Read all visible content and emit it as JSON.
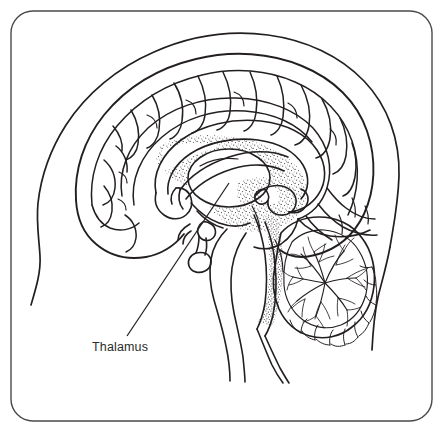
{
  "figure": {
    "kind": "anatomical-line-diagram",
    "background_color": "#ffffff",
    "ink_color": "#231f20",
    "frame": {
      "present": true,
      "shape": "rounded-rectangle",
      "stroke_color": "#4a4a4a",
      "x": 11,
      "y": 11,
      "width": 421,
      "height": 410,
      "corner_radius": 22
    },
    "labels": [
      {
        "id": "thalamus",
        "text": "Thalamus",
        "text_x": 92,
        "text_y": 351,
        "leader_from_x": 127,
        "leader_from_y": 336,
        "leader_to_x": 229,
        "leader_to_y": 183
      }
    ],
    "structures": [
      {
        "name": "scalp-and-face-outline",
        "visible": true
      },
      {
        "name": "cerebral-cortex",
        "visible": true
      },
      {
        "name": "cerebral-gyri-and-sulci",
        "visible": true
      },
      {
        "name": "cingulate-gyrus",
        "visible": true
      },
      {
        "name": "corpus-callosum",
        "visible": true
      },
      {
        "name": "fornix",
        "visible": true
      },
      {
        "name": "lateral-ventricle",
        "visible": true
      },
      {
        "name": "thalamus",
        "visible": true
      },
      {
        "name": "hypothalamus",
        "visible": true
      },
      {
        "name": "pituitary-gland",
        "visible": true
      },
      {
        "name": "optic-chiasm",
        "visible": true
      },
      {
        "name": "midbrain",
        "visible": true
      },
      {
        "name": "pons",
        "visible": true
      },
      {
        "name": "medulla-oblongata",
        "visible": true
      },
      {
        "name": "spinal-cord",
        "visible": true
      },
      {
        "name": "cerebellum",
        "visible": true
      },
      {
        "name": "arbor-vitae",
        "visible": true
      },
      {
        "name": "fourth-ventricle",
        "visible": true
      },
      {
        "name": "pineal-body",
        "visible": true
      }
    ],
    "texture": {
      "name": "stipple-shading",
      "description": "fine dotted stippling around deep midline structures",
      "dot_color": "#3a3a3a"
    }
  }
}
